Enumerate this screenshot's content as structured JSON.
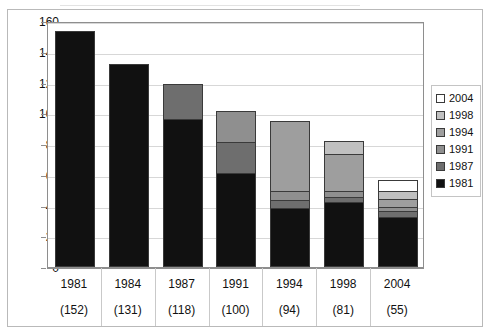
{
  "chart_data": {
    "type": "bar",
    "stacked": true,
    "title": "",
    "xlabel": "",
    "ylabel": "",
    "ylim": [
      0,
      160
    ],
    "ytick_step": 20,
    "yticks": [
      0,
      20,
      40,
      60,
      80,
      100,
      120,
      140,
      160
    ],
    "grid": true,
    "legend_position": "right",
    "categories": [
      "1981",
      "1984",
      "1987",
      "1991",
      "1994",
      "1998",
      "2004"
    ],
    "category_totals": [
      "(152)",
      "(131)",
      "(118)",
      "(100)",
      "(94)",
      "(81)",
      "(55)"
    ],
    "totals": [
      152,
      131,
      118,
      100,
      94,
      81,
      55
    ],
    "series": [
      {
        "name": "1981",
        "color": "#111111",
        "values": [
          152,
          131,
          95,
          60,
          37,
          41,
          31
        ]
      },
      {
        "name": "1987",
        "color": "#6e6e6e",
        "values": [
          0,
          0,
          23,
          20,
          5,
          3,
          4
        ]
      },
      {
        "name": "1991",
        "color": "#8f8f8f",
        "values": [
          0,
          0,
          0,
          20,
          6,
          4,
          3
        ]
      },
      {
        "name": "1994",
        "color": "#9e9e9e",
        "values": [
          0,
          0,
          0,
          0,
          46,
          24,
          5
        ]
      },
      {
        "name": "1998",
        "color": "#c0c0c0",
        "values": [
          0,
          0,
          0,
          0,
          0,
          9,
          5
        ]
      },
      {
        "name": "2004",
        "color": "#ffffff",
        "values": [
          0,
          0,
          0,
          0,
          0,
          0,
          7
        ]
      }
    ],
    "legend_entries": [
      {
        "label": "2004",
        "color": "#ffffff"
      },
      {
        "label": "1998",
        "color": "#c0c0c0"
      },
      {
        "label": "1994",
        "color": "#9e9e9e"
      },
      {
        "label": "1991",
        "color": "#8f8f8f"
      },
      {
        "label": "1987",
        "color": "#6e6e6e"
      },
      {
        "label": "1981",
        "color": "#111111"
      }
    ]
  }
}
